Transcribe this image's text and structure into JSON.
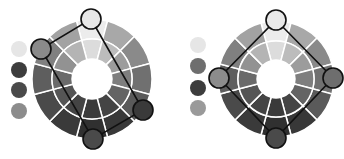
{
  "diagrams": [
    {
      "name": "tetradic-rectangle-scheme",
      "wheel": {
        "cx": 92,
        "cy": 79,
        "r_outer": 60,
        "r_mid": 40,
        "r_inner": 20
      },
      "swatches": [
        {
          "cx": 19,
          "cy": 49,
          "r": 8,
          "color": "#e6e6e6"
        },
        {
          "cx": 19,
          "cy": 70,
          "r": 8,
          "color": "#3d3d3d"
        },
        {
          "cx": 19,
          "cy": 90,
          "r": 8,
          "color": "#4a4a4a"
        },
        {
          "cx": 19,
          "cy": 111,
          "r": 8,
          "color": "#8c8c8c"
        }
      ],
      "markers": [
        {
          "cx": 91,
          "cy": 19,
          "r": 10,
          "color": "#e8e8e8"
        },
        {
          "cx": 41,
          "cy": 49,
          "r": 10,
          "color": "#8a8a8a"
        },
        {
          "cx": 143,
          "cy": 110,
          "r": 10,
          "color": "#3a3a3a"
        },
        {
          "cx": 93,
          "cy": 139,
          "r": 10,
          "color": "#4a4a4a"
        }
      ],
      "polygon_order": [
        0,
        2,
        3,
        1
      ]
    },
    {
      "name": "tetradic-square-scheme",
      "wheel": {
        "cx": 276,
        "cy": 79,
        "r_outer": 58,
        "r_mid": 38,
        "r_inner": 19
      },
      "swatches": [
        {
          "cx": 198,
          "cy": 45,
          "r": 8,
          "color": "#e6e6e6"
        },
        {
          "cx": 198,
          "cy": 66,
          "r": 8,
          "color": "#6e6e6e"
        },
        {
          "cx": 198,
          "cy": 88,
          "r": 8,
          "color": "#3d3d3d"
        },
        {
          "cx": 198,
          "cy": 108,
          "r": 8,
          "color": "#9a9a9a"
        }
      ],
      "markers": [
        {
          "cx": 276,
          "cy": 20,
          "r": 10,
          "color": "#e8e8e8"
        },
        {
          "cx": 333,
          "cy": 78,
          "r": 10,
          "color": "#6e6e6e"
        },
        {
          "cx": 276,
          "cy": 138,
          "r": 10,
          "color": "#4a4a4a"
        },
        {
          "cx": 219,
          "cy": 78,
          "r": 10,
          "color": "#8c8c8c"
        }
      ],
      "polygon_order": [
        0,
        1,
        2,
        3
      ]
    }
  ],
  "wheel_segments": {
    "count": 12,
    "outer_shades": [
      "#ececec",
      "#a8a8a8",
      "#8a8a8a",
      "#707070",
      "#5a5a5a",
      "#383838",
      "#303030",
      "#3a3a3a",
      "#4a4a4a",
      "#5e5e5e",
      "#808080",
      "#a2a2a2"
    ],
    "inner_shades": [
      "#dcdcdc",
      "#bcbcbc",
      "#9c9c9c",
      "#7e7e7e",
      "#646464",
      "#444444",
      "#3a3a3a",
      "#444444",
      "#555555",
      "#6a6a6a",
      "#929292",
      "#b4b4b4"
    ],
    "gap_color": "#ffffff"
  }
}
